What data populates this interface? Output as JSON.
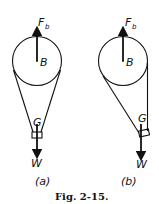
{
  "figure": {
    "caption": "Fig. 2-15.",
    "panels": [
      {
        "id": "a",
        "label": "(a)",
        "force_label": "F",
        "force_sub": "b",
        "center_label": "B",
        "cg_label": "G",
        "weight_label": "W"
      },
      {
        "id": "b",
        "label": "(b)",
        "force_label": "F",
        "force_sub": "b",
        "center_label": "B",
        "cg_label": "G",
        "weight_label": "W"
      }
    ]
  },
  "colors": {
    "ink": "#111111",
    "background": "#ffffff"
  }
}
